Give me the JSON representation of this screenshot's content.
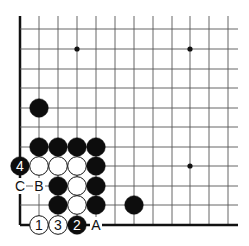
{
  "board": {
    "background": "#ffffff",
    "line_color": "#555555",
    "edge_color": "#111111",
    "cols_x": [
      20,
      39,
      58,
      77,
      96,
      115,
      134,
      153,
      172,
      190,
      209,
      228
    ],
    "rows_y": [
      29,
      49,
      69,
      88,
      108,
      127,
      147,
      166,
      186,
      205,
      225
    ],
    "top_y": 16,
    "right_x": 238,
    "edges": [
      "left",
      "bottom"
    ],
    "star_points": [
      [
        77,
        49
      ],
      [
        190,
        49
      ],
      [
        190,
        166
      ]
    ]
  },
  "stones": [
    {
      "color": "black",
      "x": 39,
      "y": 108,
      "label": ""
    },
    {
      "color": "black",
      "x": 39,
      "y": 147,
      "label": ""
    },
    {
      "color": "black",
      "x": 58,
      "y": 147,
      "label": ""
    },
    {
      "color": "black",
      "x": 77,
      "y": 147,
      "label": ""
    },
    {
      "color": "black",
      "x": 96,
      "y": 147,
      "label": ""
    },
    {
      "color": "black",
      "x": 20,
      "y": 166,
      "label": "4"
    },
    {
      "color": "white",
      "x": 39,
      "y": 166,
      "label": ""
    },
    {
      "color": "white",
      "x": 58,
      "y": 166,
      "label": ""
    },
    {
      "color": "white",
      "x": 77,
      "y": 166,
      "label": ""
    },
    {
      "color": "black",
      "x": 96,
      "y": 166,
      "label": ""
    },
    {
      "color": "black",
      "x": 58,
      "y": 186,
      "label": ""
    },
    {
      "color": "white",
      "x": 77,
      "y": 186,
      "label": ""
    },
    {
      "color": "black",
      "x": 96,
      "y": 186,
      "label": ""
    },
    {
      "color": "black",
      "x": 58,
      "y": 205,
      "label": ""
    },
    {
      "color": "white",
      "x": 77,
      "y": 205,
      "label": ""
    },
    {
      "color": "black",
      "x": 96,
      "y": 205,
      "label": ""
    },
    {
      "color": "black",
      "x": 134,
      "y": 205,
      "label": ""
    },
    {
      "color": "white",
      "x": 39,
      "y": 225,
      "label": "1"
    },
    {
      "color": "white",
      "x": 58,
      "y": 225,
      "label": "3"
    },
    {
      "color": "black",
      "x": 77,
      "y": 225,
      "label": "2"
    }
  ],
  "point_labels": [
    {
      "text": "C",
      "x": 20,
      "y": 186
    },
    {
      "text": "B",
      "x": 39,
      "y": 186
    },
    {
      "text": "A",
      "x": 96,
      "y": 225
    }
  ]
}
